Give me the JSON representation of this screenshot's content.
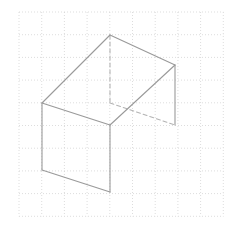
{
  "figure": {
    "canvas": {
      "width": 231,
      "height": 228,
      "background": "#ffffff"
    },
    "grid": {
      "name": "dotted-square-grid",
      "origin_x": 19,
      "origin_y": 12,
      "spacing": 22.7,
      "columns": 9,
      "rows": 9,
      "line_color": "#cfcfcf",
      "line_width": 0.7,
      "dash_pattern": "1 2",
      "style": "dotted"
    },
    "solid": {
      "name": "oblique-prism",
      "stroke_color": "#9a9a9a",
      "hidden_stroke_color": "#b4b4b4",
      "stroke_width": 1.1,
      "hidden_dash_pattern": "4 3",
      "fill": "none",
      "vertices": {
        "top_left": {
          "label": "A",
          "x": 42,
          "y": 103
        },
        "top_apex": {
          "label": "B",
          "x": 110,
          "y": 35
        },
        "top_right": {
          "label": "C",
          "x": 175,
          "y": 65
        },
        "top_front": {
          "label": "D",
          "x": 110,
          "y": 125
        },
        "hidden_back": {
          "label": "E",
          "x": 110,
          "y": 103
        },
        "bottom_right": {
          "label": "F",
          "x": 175,
          "y": 125
        },
        "bottom_left": {
          "label": "G",
          "x": 42,
          "y": 170
        },
        "bottom_front": {
          "label": "H",
          "x": 110,
          "y": 192
        }
      },
      "faces": [
        {
          "name": "top-face",
          "points": "42,103 110,35 175,65 110,125"
        },
        {
          "name": "front-left-face",
          "points": "42,103 110,125 110,192 42,170"
        }
      ],
      "visible_edges": [
        {
          "name": "edge-top-left-to-apex",
          "x1": 42,
          "y1": 103,
          "x2": 110,
          "y2": 35
        },
        {
          "name": "edge-apex-to-top-right",
          "x1": 110,
          "y1": 35,
          "x2": 175,
          "y2": 65
        },
        {
          "name": "edge-top-right-to-top-front",
          "x1": 175,
          "y1": 65,
          "x2": 110,
          "y2": 125
        },
        {
          "name": "edge-top-front-to-top-left",
          "x1": 110,
          "y1": 125,
          "x2": 42,
          "y2": 103
        },
        {
          "name": "edge-left-vertical",
          "x1": 42,
          "y1": 103,
          "x2": 42,
          "y2": 170
        },
        {
          "name": "edge-front-vertical",
          "x1": 110,
          "y1": 125,
          "x2": 110,
          "y2": 192
        },
        {
          "name": "edge-right-vertical",
          "x1": 175,
          "y1": 65,
          "x2": 175,
          "y2": 125
        },
        {
          "name": "edge-bottom-left-to-bottom-front",
          "x1": 42,
          "y1": 170,
          "x2": 110,
          "y2": 192
        }
      ],
      "hidden_edges": [
        {
          "name": "hidden-edge-apex-vertical",
          "x1": 110,
          "y1": 35,
          "x2": 110,
          "y2": 103
        },
        {
          "name": "hidden-edge-back-to-bottom-right",
          "x1": 110,
          "y1": 103,
          "x2": 175,
          "y2": 125
        }
      ]
    }
  }
}
